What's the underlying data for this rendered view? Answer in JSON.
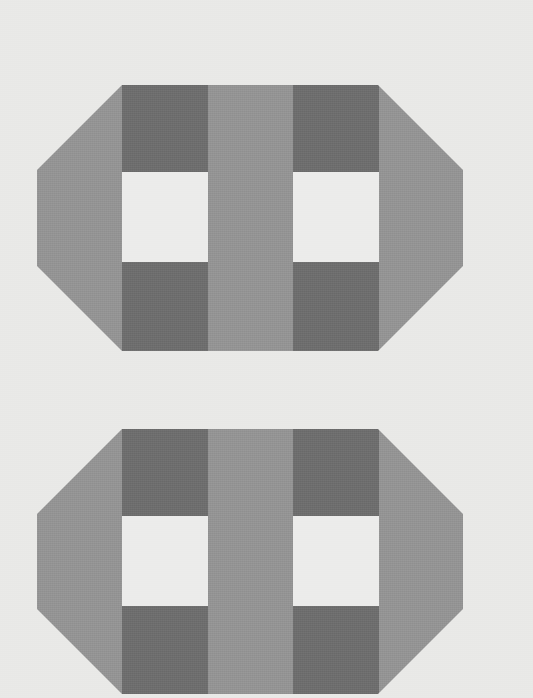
{
  "image": {
    "title": "Gingham Check Octagon Pair",
    "width": 533,
    "height": 698,
    "background_color": "#e9e9e7",
    "description": "Two identical octagonal (corner-cut rectangle) swatches filled with a three-tone gingham / buffalo-check plaid pattern on a light warm-gray ground. The lower swatch is cropped by the bottom edge of the frame."
  },
  "palette": {
    "background": "#e9e9e7",
    "light": "#ececeb",
    "mid": "#949494",
    "dark": "#6e6e6e"
  },
  "pattern": {
    "name": "gingham-check",
    "columns": 5,
    "rows": 3,
    "column_edges_px": [
      37,
      122,
      208,
      293,
      379,
      463
    ],
    "row_edges_px": [
      85,
      172,
      262,
      351
    ],
    "column_types": [
      "stripe",
      "gap",
      "stripe",
      "gap",
      "stripe"
    ],
    "row_types": [
      "stripe",
      "gap",
      "stripe"
    ],
    "tone_rule": "stripe+stripe = dark, stripe+gap = mid, gap+gap = light",
    "cells": [
      [
        "mid",
        "dark",
        "mid",
        "dark",
        "mid"
      ],
      [
        "mid",
        "light",
        "mid",
        "light",
        "mid"
      ],
      [
        "mid",
        "dark",
        "mid",
        "dark",
        "mid"
      ]
    ]
  },
  "shapes": [
    {
      "id": "octagon-top",
      "label": "Top gingham octagon",
      "left": 37,
      "right": 463,
      "top": 85,
      "bottom": 351,
      "corner_cut": 85,
      "clipped": "false"
    },
    {
      "id": "octagon-bottom",
      "label": "Bottom gingham octagon",
      "left": 37,
      "right": 463,
      "top": 429,
      "bottom": 694,
      "corner_cut": 85,
      "clipped": "true"
    }
  ]
}
